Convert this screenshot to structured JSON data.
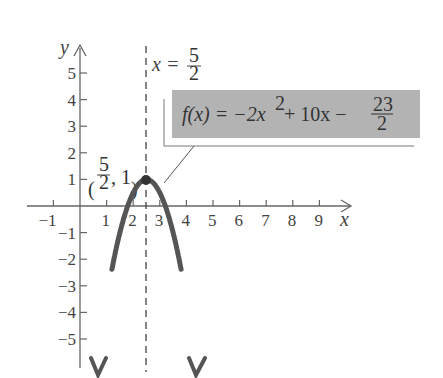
{
  "chart_data": {
    "type": "line",
    "title": "",
    "function": "f(x) = -2x^2 + 10x - 23/2",
    "xlabel": "x",
    "ylabel": "y",
    "xlim": [
      -1.5,
      10
    ],
    "ylim": [
      -6,
      6
    ],
    "x_ticks": [
      -1,
      1,
      2,
      3,
      4,
      5,
      6,
      7,
      8,
      9
    ],
    "y_ticks": [
      5,
      4,
      3,
      2,
      1,
      -1,
      -2,
      -3,
      -4,
      -5
    ],
    "grid": false,
    "series": [
      {
        "name": "f(x)",
        "x": [
          1.2,
          1.5,
          2,
          2.5,
          3,
          3.5,
          3.8
        ],
        "y": [
          -4.88,
          -2.5,
          0.5,
          1,
          0.5,
          -2.5,
          -4.88
        ]
      }
    ],
    "annotations": {
      "vertex_label": [
        "(",
        "5",
        "2",
        ", 1)"
      ],
      "vertex": {
        "x": 2.5,
        "y": 1
      },
      "axis_of_symmetry": {
        "label_prefix": "x =",
        "num": "5",
        "den": "2",
        "x": 2.5
      },
      "equation_box": {
        "lhs": "f(x) = −2x",
        "exp": "2",
        "mid": " + 10x −",
        "num": "23",
        "den": "2",
        "fill": "#b3b3b3"
      }
    },
    "colors": {
      "curve": "#555555",
      "axis": "#666666",
      "box": "#b3b3b3"
    }
  }
}
